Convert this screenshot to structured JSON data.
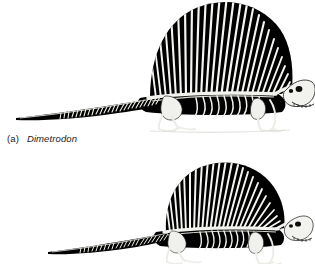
{
  "figure": {
    "background_color": "#ffffff",
    "ink_color": "#000000",
    "bone_color": "#f2f2ee",
    "caption": {
      "letter": "(a)",
      "genus": "Dimetrodon"
    },
    "panels": [
      {
        "id": "panel-a",
        "name": "dimetrodon-skeleton-upper",
        "subject": "Dimetrodon skeleton lateral view",
        "facing": "right",
        "sail_spine_count": 30,
        "cropped_edges": "top",
        "features": [
          "dorsal sail",
          "neural spines",
          "skull",
          "orbit",
          "jaw with teeth",
          "cervical vertebrae",
          "dorsal vertebrae",
          "ribs",
          "pectoral girdle",
          "forelimb",
          "pelvic girdle",
          "hindlimb",
          "caudal vertebrae",
          "tail"
        ]
      },
      {
        "id": "panel-b",
        "name": "dimetrodon-skeleton-lower",
        "subject": "Dimetrodon skeleton lateral view",
        "facing": "right",
        "sail_spine_count": 28,
        "cropped_edges": "bottom",
        "features": [
          "dorsal sail",
          "neural spines",
          "skull",
          "orbit",
          "jaw with teeth",
          "dorsal vertebrae",
          "ribs",
          "forelimb",
          "hindlimb",
          "tail"
        ]
      }
    ]
  }
}
